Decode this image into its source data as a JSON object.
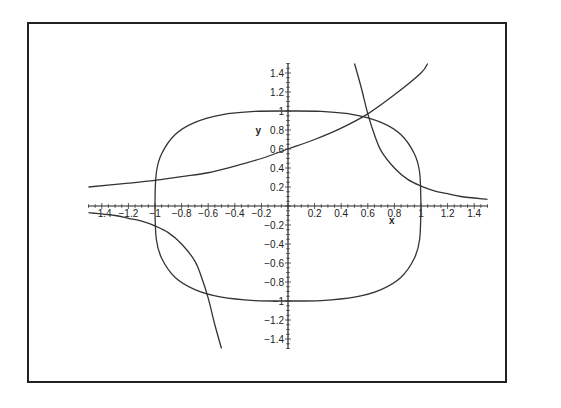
{
  "chart_data": {
    "type": "line",
    "title": "",
    "xlabel": "x",
    "ylabel": "y",
    "xlim": [
      -1.5,
      1.5
    ],
    "ylim": [
      -1.5,
      1.5
    ],
    "grid": false,
    "legend": "none",
    "x_ticks": [
      "-1.4",
      "-1.2",
      "-1",
      "-0.8",
      "-0.6",
      "-0.4",
      "-0.2",
      "0.2",
      "0.4",
      "0.6",
      "0.8",
      "1",
      "1.2",
      "1.4"
    ],
    "y_ticks": [
      "1.4",
      "1.2",
      "1",
      "0.8",
      "0.6",
      "0.4",
      "0.2",
      "-0.2",
      "-0.4",
      "-0.6",
      "-0.8",
      "-1",
      "-1.2",
      "-1.4"
    ],
    "series": [
      {
        "name": "superellipse (x^4 + y^4 = 1)",
        "closed": true,
        "points": [
          [
            1,
            0
          ],
          [
            0.99,
            0.35
          ],
          [
            0.95,
            0.55
          ],
          [
            0.85,
            0.75
          ],
          [
            0.7,
            0.88
          ],
          [
            0.5,
            0.96
          ],
          [
            0.25,
            0.995
          ],
          [
            0,
            1
          ],
          [
            -0.25,
            0.995
          ],
          [
            -0.5,
            0.96
          ],
          [
            -0.7,
            0.88
          ],
          [
            -0.85,
            0.75
          ],
          [
            -0.95,
            0.55
          ],
          [
            -0.99,
            0.35
          ],
          [
            -1,
            0
          ],
          [
            -0.99,
            -0.35
          ],
          [
            -0.95,
            -0.55
          ],
          [
            -0.85,
            -0.75
          ],
          [
            -0.7,
            -0.88
          ],
          [
            -0.5,
            -0.96
          ],
          [
            -0.25,
            -0.995
          ],
          [
            0,
            -1
          ],
          [
            0.25,
            -0.995
          ],
          [
            0.5,
            -0.96
          ],
          [
            0.7,
            -0.88
          ],
          [
            0.85,
            -0.75
          ],
          [
            0.95,
            -0.55
          ],
          [
            0.99,
            -0.35
          ],
          [
            1,
            0
          ]
        ]
      },
      {
        "name": "increasing curve",
        "points": [
          [
            -1.5,
            0.2
          ],
          [
            -1.2,
            0.24
          ],
          [
            -1,
            0.27
          ],
          [
            -0.8,
            0.31
          ],
          [
            -0.6,
            0.35
          ],
          [
            -0.4,
            0.42
          ],
          [
            -0.2,
            0.5
          ],
          [
            0,
            0.6
          ],
          [
            0.2,
            0.7
          ],
          [
            0.4,
            0.82
          ],
          [
            0.6,
            0.97
          ],
          [
            0.8,
            1.17
          ],
          [
            1,
            1.4
          ],
          [
            1.05,
            1.5
          ]
        ]
      },
      {
        "name": "upper-right decreasing curve",
        "points": [
          [
            0.5,
            1.5
          ],
          [
            0.55,
            1.25
          ],
          [
            0.6,
            0.97
          ],
          [
            0.65,
            0.75
          ],
          [
            0.7,
            0.58
          ],
          [
            0.8,
            0.4
          ],
          [
            0.9,
            0.28
          ],
          [
            1,
            0.21
          ],
          [
            1.1,
            0.16
          ],
          [
            1.2,
            0.13
          ],
          [
            1.3,
            0.1
          ],
          [
            1.5,
            0.07
          ]
        ]
      },
      {
        "name": "lower-left decreasing curve",
        "points": [
          [
            -1.5,
            -0.07
          ],
          [
            -1.3,
            -0.1
          ],
          [
            -1.2,
            -0.13
          ],
          [
            -1.1,
            -0.16
          ],
          [
            -1,
            -0.21
          ],
          [
            -0.9,
            -0.28
          ],
          [
            -0.8,
            -0.4
          ],
          [
            -0.7,
            -0.58
          ],
          [
            -0.65,
            -0.75
          ],
          [
            -0.6,
            -0.97
          ],
          [
            -0.55,
            -1.25
          ],
          [
            -0.5,
            -1.5
          ]
        ]
      }
    ]
  }
}
